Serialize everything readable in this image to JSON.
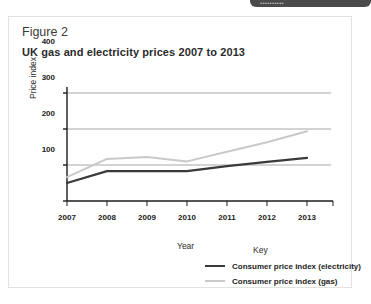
{
  "top_bar": {
    "text": "••••••••••"
  },
  "figure": {
    "label": "Figure 2",
    "title": "UK gas and electricity prices 2007 to 2013"
  },
  "legend": {
    "heading": "Key",
    "items": [
      {
        "label": "Consumer price index (electricity)",
        "color": "#3a3a3a"
      },
      {
        "label": "Consumer price index (gas)",
        "color": "#c9c9c9"
      }
    ]
  },
  "colors": {
    "electricity": "#3a3a3a",
    "gas": "#c9c9c9",
    "gridline": "#a8a8a8",
    "axis": "#1c1c1c",
    "card_border": "#e2e2e2",
    "top_bar": "#4a4a4a"
  },
  "chart_data": {
    "type": "line",
    "title": "UK gas and electricity prices 2007 to 2013",
    "xlabel": "Year",
    "ylabel": "Price index",
    "x": [
      2007,
      2008,
      2009,
      2010,
      2011,
      2012,
      2013
    ],
    "categories": [
      "2007",
      "2008",
      "2009",
      "2010",
      "2011",
      "2012",
      "2013"
    ],
    "xlim": [
      2007,
      2013
    ],
    "ylim": [
      100,
      400
    ],
    "yticks": [
      100,
      200,
      300,
      400
    ],
    "grid": true,
    "legend_position": "bottom-right",
    "series": [
      {
        "name": "Consumer price index (electricity)",
        "color": "#3a3a3a",
        "values": [
          150,
          183,
          183,
          183,
          197,
          209,
          220
        ]
      },
      {
        "name": "Consumer price index (gas)",
        "color": "#c9c9c9",
        "values": [
          166,
          217,
          222,
          210,
          237,
          263,
          294
        ]
      }
    ]
  }
}
